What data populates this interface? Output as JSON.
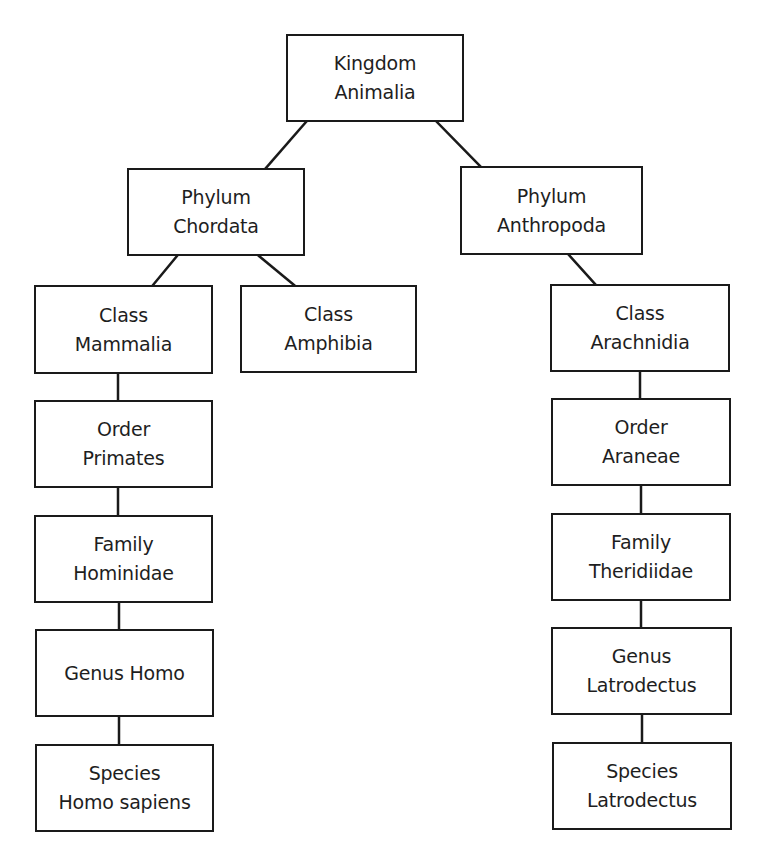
{
  "diagram": {
    "type": "taxonomy-tree",
    "nodes": [
      {
        "id": "kingdom-animalia",
        "line1": "Kingdom",
        "line2": "Animalia",
        "x": 286,
        "y": 34,
        "w": 178,
        "h": 88
      },
      {
        "id": "phylum-chordata",
        "line1": "Phylum",
        "line2": "Chordata",
        "x": 127,
        "y": 168,
        "w": 178,
        "h": 88
      },
      {
        "id": "phylum-anthropoda",
        "line1": "Phylum",
        "line2": "Anthropoda",
        "x": 460,
        "y": 166,
        "w": 183,
        "h": 89
      },
      {
        "id": "class-mammalia",
        "line1": "Class",
        "line2": "Mammalia",
        "x": 34,
        "y": 285,
        "w": 179,
        "h": 89
      },
      {
        "id": "class-amphibia",
        "line1": "Class",
        "line2": "Amphibia",
        "x": 240,
        "y": 285,
        "w": 177,
        "h": 88
      },
      {
        "id": "class-arachnidia",
        "line1": "Class",
        "line2": "Arachnidia",
        "x": 550,
        "y": 284,
        "w": 180,
        "h": 88
      },
      {
        "id": "order-primates",
        "line1": "Order",
        "line2": "Primates",
        "x": 34,
        "y": 400,
        "w": 179,
        "h": 88
      },
      {
        "id": "family-hominidae",
        "line1": "Family",
        "line2": "Hominidae",
        "x": 34,
        "y": 515,
        "w": 179,
        "h": 88
      },
      {
        "id": "genus-homo",
        "line1": "Genus Homo",
        "line2": "",
        "x": 35,
        "y": 629,
        "w": 179,
        "h": 88
      },
      {
        "id": "species-homo-sapiens",
        "line1": "Species",
        "line2": "Homo sapiens",
        "x": 35,
        "y": 744,
        "w": 179,
        "h": 88
      },
      {
        "id": "order-araneae",
        "line1": "Order",
        "line2": "Araneae",
        "x": 551,
        "y": 398,
        "w": 180,
        "h": 88
      },
      {
        "id": "family-theridiidae",
        "line1": "Family",
        "line2": "Theridiidae",
        "x": 551,
        "y": 513,
        "w": 180,
        "h": 88
      },
      {
        "id": "genus-latrodectus",
        "line1": "Genus",
        "line2": "Latrodectus",
        "x": 551,
        "y": 627,
        "w": 181,
        "h": 88
      },
      {
        "id": "species-latrodectus",
        "line1": "Species",
        "line2": "Latrodectus",
        "x": 552,
        "y": 742,
        "w": 180,
        "h": 88
      }
    ],
    "edges": [
      {
        "from": "kingdom-animalia",
        "to": "phylum-chordata",
        "x1": 306,
        "y1": 122,
        "x2": 266,
        "y2": 168
      },
      {
        "from": "kingdom-animalia",
        "to": "phylum-anthropoda",
        "x1": 437,
        "y1": 122,
        "x2": 480,
        "y2": 166
      },
      {
        "from": "phylum-chordata",
        "to": "class-mammalia",
        "x1": 177,
        "y1": 256,
        "x2": 153,
        "y2": 285
      },
      {
        "from": "phylum-chordata",
        "to": "class-amphibia",
        "x1": 259,
        "y1": 256,
        "x2": 294,
        "y2": 285
      },
      {
        "from": "phylum-anthropoda",
        "to": "class-arachnidia",
        "x1": 569,
        "y1": 255,
        "x2": 595,
        "y2": 284
      },
      {
        "from": "class-mammalia",
        "to": "order-primates",
        "x1": 118,
        "y1": 374,
        "x2": 118,
        "y2": 400
      },
      {
        "from": "order-primates",
        "to": "family-hominidae",
        "x1": 118,
        "y1": 488,
        "x2": 118,
        "y2": 515
      },
      {
        "from": "family-hominidae",
        "to": "genus-homo",
        "x1": 119,
        "y1": 603,
        "x2": 119,
        "y2": 629
      },
      {
        "from": "genus-homo",
        "to": "species-homo-sapiens",
        "x1": 119,
        "y1": 717,
        "x2": 119,
        "y2": 744
      },
      {
        "from": "class-arachnidia",
        "to": "order-araneae",
        "x1": 640,
        "y1": 372,
        "x2": 640,
        "y2": 398
      },
      {
        "from": "order-araneae",
        "to": "family-theridiidae",
        "x1": 641,
        "y1": 486,
        "x2": 641,
        "y2": 513
      },
      {
        "from": "family-theridiidae",
        "to": "genus-latrodectus",
        "x1": 641,
        "y1": 601,
        "x2": 641,
        "y2": 627
      },
      {
        "from": "genus-latrodectus",
        "to": "species-latrodectus",
        "x1": 642,
        "y1": 715,
        "x2": 642,
        "y2": 742
      }
    ],
    "colors": {
      "line": "#1a1a1a",
      "box_fill": "#ffffff",
      "text": "#1e1e1e",
      "background": "#ffffff"
    }
  }
}
